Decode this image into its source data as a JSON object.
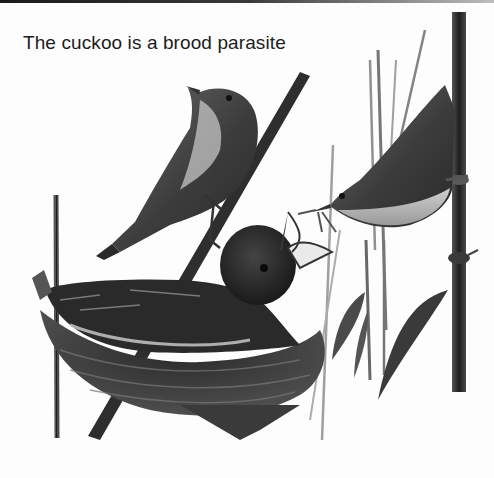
{
  "caption": {
    "text": "The cuckoo is a brood parasite"
  },
  "illustration": {
    "style": "grayscale pencil illustration",
    "subjects": [
      {
        "name": "reed-warbler-perched",
        "description": "reed warbler perched on a diagonal reed stem"
      },
      {
        "name": "reed-warbler-feeding",
        "description": "reed warbler clinging to a vertical reed, beak holding an insect"
      },
      {
        "name": "cuckoo-chick",
        "description": "large cuckoo chick in nest with open beak"
      },
      {
        "name": "nest",
        "description": "woven grass nest among reeds"
      },
      {
        "name": "reeds",
        "description": "vertical reed stems and leaves"
      }
    ]
  },
  "colors": {
    "background": "#fdfdfd",
    "ink_dark": "#1e1e1e",
    "ink_mid": "#4a4a4a",
    "ink_light": "#8a8a8a",
    "text": "#1c1c1c"
  }
}
